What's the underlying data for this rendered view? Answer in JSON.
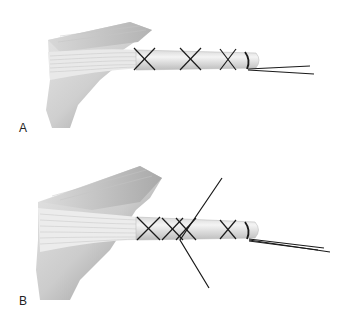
{
  "figure": {
    "panels": [
      {
        "id": "A",
        "label": "A",
        "description": "Tendon end secured with three crisscross whipstitches and a locking end loop; two suture tails exit distally"
      },
      {
        "id": "B",
        "label": "B",
        "description": "Tendon end with crisscross whipstitches; a second suture crosses obliquely through the tendon; two suture tails exit distally"
      }
    ],
    "colors": {
      "background": "#ffffff",
      "tissue_light": "#eeeeee",
      "tissue_mid": "#cfcfcf",
      "tissue_dark": "#9a9a9a",
      "suture": "#1a1a1a"
    }
  }
}
